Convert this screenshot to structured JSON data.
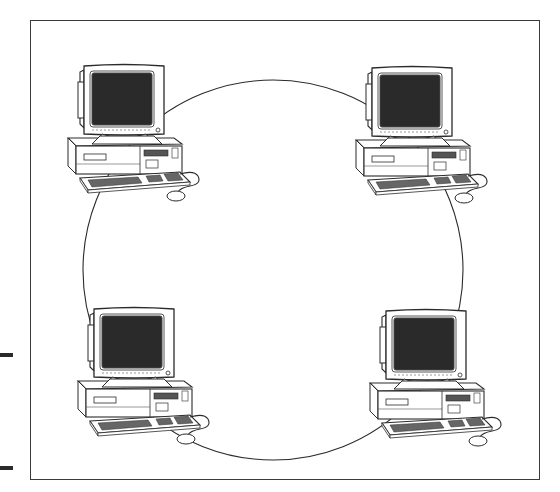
{
  "diagram": {
    "type": "ring-network-topology",
    "colors": {
      "line": "#2b2b2b",
      "screen": "#2a2a2a",
      "body": "#ffffff",
      "frame": "#3a3a3a",
      "margin_mark": "#2a2a2a"
    },
    "ring": {
      "cx": 273,
      "cy": 270,
      "r": 190
    },
    "nodes": [
      {
        "id": "computer-top-left",
        "label": "Computer",
        "x": 62,
        "y": 62
      },
      {
        "id": "computer-top-right",
        "label": "Computer",
        "x": 350,
        "y": 64
      },
      {
        "id": "computer-bottom-left",
        "label": "Computer",
        "x": 72,
        "y": 305
      },
      {
        "id": "computer-bottom-right",
        "label": "Computer",
        "x": 364,
        "y": 307
      }
    ],
    "margin_marks": [
      {
        "y": 353
      },
      {
        "y": 466
      }
    ]
  }
}
